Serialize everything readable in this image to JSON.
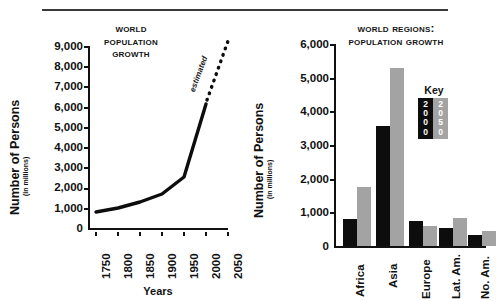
{
  "figure": {
    "rule_present": true
  },
  "left_chart": {
    "title_lines": [
      "World",
      "Population",
      "Growth"
    ],
    "y_axis_title": "Number of Persons",
    "y_axis_subtitle": "(in millions)",
    "x_axis_title": "Years",
    "annotation": "estimated"
  },
  "right_chart": {
    "title_lines": [
      "World Regions:",
      "Population Growth"
    ],
    "y_axis_title": "Number of Persons",
    "y_axis_subtitle": "(in millions)",
    "key_title": "Key",
    "key_items": [
      {
        "label": "2000",
        "color": "#0d0d0d"
      },
      {
        "label": "2050",
        "color": "#a3a3a3"
      }
    ]
  },
  "chart_data": [
    {
      "type": "line",
      "title": "World Population Growth",
      "xlabel": "Years",
      "ylabel": "Number of Persons (in millions)",
      "ylim": [
        0,
        9000
      ],
      "ytick_labels": [
        "0",
        "1,000",
        "2,000",
        "3,000",
        "4,000",
        "5,000",
        "6,000",
        "7,000",
        "8,000",
        "9,000"
      ],
      "yticks": [
        0,
        1000,
        2000,
        3000,
        4000,
        5000,
        6000,
        7000,
        8000,
        9000
      ],
      "xtick_labels": [
        "1750",
        "1800",
        "1850",
        "1900",
        "1950",
        "2000",
        "2050"
      ],
      "xticks": [
        1750,
        1800,
        1850,
        1900,
        1950,
        2000,
        2050
      ],
      "grid": false,
      "legend": "none",
      "series": [
        {
          "name": "Actual population",
          "style": "solid",
          "x": [
            1750,
            1800,
            1850,
            1900,
            1950,
            2000
          ],
          "values": [
            790,
            980,
            1260,
            1650,
            2520,
            6080
          ]
        },
        {
          "name": "Estimated population",
          "style": "dotted",
          "annotation": "estimated",
          "x": [
            2000,
            2050
          ],
          "values": [
            6080,
            9000
          ]
        }
      ]
    },
    {
      "type": "bar",
      "title": "World Regions: Population Growth",
      "xlabel": "",
      "ylabel": "Number of Persons (in millions)",
      "ylim": [
        0,
        6000
      ],
      "ytick_labels": [
        "0",
        "1,000",
        "2,000",
        "3,000",
        "4,000",
        "5,000",
        "6,000"
      ],
      "yticks": [
        0,
        1000,
        2000,
        3000,
        4000,
        5000,
        6000
      ],
      "categories": [
        "Africa",
        "Asia",
        "Europe",
        "Lat. Am.",
        "No. Am."
      ],
      "grid": false,
      "legend": "inset-key",
      "series": [
        {
          "name": "2000",
          "color": "#0d0d0d",
          "values": [
            790,
            3560,
            740,
            540,
            320
          ]
        },
        {
          "name": "2050",
          "color": "#a3a3a3",
          "values": [
            1750,
            5300,
            600,
            830,
            440
          ]
        }
      ]
    }
  ]
}
